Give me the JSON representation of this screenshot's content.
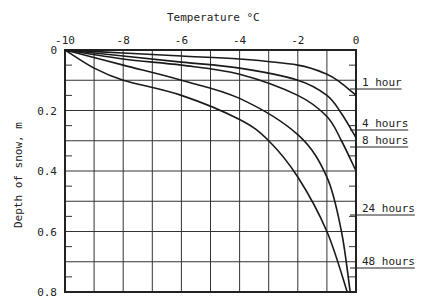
{
  "chart_data": {
    "type": "line",
    "title": "",
    "xlabel": "Temperature °C",
    "ylabel": "Depth of snow, m",
    "xlim": [
      -10,
      0
    ],
    "ylim": [
      0,
      0.8
    ],
    "y_inverted": true,
    "x_axis_position": "top",
    "grid": true,
    "x_ticks": [
      "-10",
      "-8",
      "-6",
      "-4",
      "-2",
      "0"
    ],
    "y_ticks": [
      "0",
      "0.2",
      "0.4",
      "0.6",
      "0.8"
    ],
    "legend_position": "right (inline labels)",
    "series": [
      {
        "name": "1 hour",
        "points": [
          [
            -10,
            0
          ],
          [
            -8,
            0.01
          ],
          [
            -6,
            0.02
          ],
          [
            -4,
            0.03
          ],
          [
            -2,
            0.05
          ],
          [
            -1,
            0.08
          ],
          [
            -0.5,
            0.11
          ],
          [
            0,
            0.15
          ]
        ]
      },
      {
        "name": "4 hours",
        "points": [
          [
            -10,
            0
          ],
          [
            -8,
            0.02
          ],
          [
            -6,
            0.04
          ],
          [
            -4,
            0.06
          ],
          [
            -2,
            0.1
          ],
          [
            -1,
            0.15
          ],
          [
            -0.5,
            0.21
          ],
          [
            0,
            0.29
          ]
        ]
      },
      {
        "name": "8 hours",
        "points": [
          [
            -10,
            0
          ],
          [
            -8,
            0.03
          ],
          [
            -6,
            0.05
          ],
          [
            -4,
            0.08
          ],
          [
            -2,
            0.15
          ],
          [
            -1,
            0.22
          ],
          [
            -0.5,
            0.3
          ],
          [
            0,
            0.4
          ]
        ]
      },
      {
        "name": "24 hours",
        "points": [
          [
            -10,
            0
          ],
          [
            -8,
            0.05
          ],
          [
            -6,
            0.1
          ],
          [
            -4,
            0.16
          ],
          [
            -2,
            0.28
          ],
          [
            -1,
            0.42
          ],
          [
            -0.5,
            0.6
          ],
          [
            -0.2,
            0.8
          ]
        ]
      },
      {
        "name": "48 hours",
        "points": [
          [
            -10,
            0
          ],
          [
            -9,
            0.06
          ],
          [
            -8,
            0.1
          ],
          [
            -6,
            0.15
          ],
          [
            -4,
            0.23
          ],
          [
            -3,
            0.3
          ],
          [
            -2,
            0.42
          ],
          [
            -1,
            0.6
          ],
          [
            -0.3,
            0.8
          ]
        ]
      }
    ]
  },
  "labels": {
    "xlabel": "Temperature °C",
    "ylabel": "Depth of snow, m",
    "series": [
      "1 hour",
      "4 hours",
      "8 hours",
      "24 hours",
      "48 hours"
    ]
  }
}
